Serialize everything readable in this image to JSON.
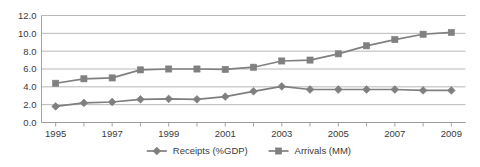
{
  "chart_data": {
    "type": "line",
    "title": "",
    "subtitle": "",
    "xlabel": "",
    "ylabel": "",
    "x": [
      1995,
      1996,
      1997,
      1998,
      1999,
      2000,
      2001,
      2002,
      2003,
      2004,
      2005,
      2006,
      2007,
      2008,
      2009
    ],
    "xlim": [
      1994.5,
      2009.5
    ],
    "ylim": [
      0.0,
      12.0
    ],
    "y_ticks": [
      0.0,
      2.0,
      4.0,
      6.0,
      8.0,
      10.0,
      12.0
    ],
    "y_tick_labels": [
      "0.0",
      "2.0",
      "4.0",
      "6.0",
      "8.0",
      "10.0",
      "12.0"
    ],
    "x_tick_labels": [
      "1995",
      "",
      "1997",
      "",
      "1999",
      "",
      "2001",
      "",
      "2003",
      "",
      "2005",
      "",
      "2007",
      "",
      "2009"
    ],
    "x_tick_labels_shown": [
      "1995",
      "1997",
      "1999",
      "2001",
      "2003",
      "2005",
      "2007",
      "2009"
    ],
    "grid": true,
    "grid_axis": "y",
    "legend_position": "bottom",
    "series": [
      {
        "name": "Receipts (%GDP)",
        "marker": "diamond",
        "color": "#7f7f7f",
        "values": [
          1.8,
          2.2,
          2.3,
          2.6,
          2.65,
          2.6,
          2.9,
          3.5,
          4.05,
          3.7,
          3.7,
          3.7,
          3.7,
          3.6,
          3.6
        ]
      },
      {
        "name": "Arrivals (MM)",
        "marker": "square",
        "color": "#808080",
        "values": [
          4.4,
          4.9,
          5.0,
          5.9,
          6.0,
          6.0,
          5.95,
          6.2,
          6.9,
          7.0,
          7.7,
          8.6,
          9.3,
          9.9,
          10.1
        ]
      }
    ]
  },
  "legend": {
    "items": [
      {
        "label": "Receipts (%GDP)",
        "marker": "diamond-marker-icon",
        "color": "#7f7f7f"
      },
      {
        "label": "Arrivals (MM)",
        "marker": "square-marker-icon",
        "color": "#808080"
      }
    ]
  },
  "colors": {
    "plot_background": "#ffffff",
    "gridline": "#a6a6a6",
    "axis": "#9a9a9a",
    "text": "#3a3a3a",
    "series_receipts": "#7f7f7f",
    "series_arrivals": "#808080"
  }
}
